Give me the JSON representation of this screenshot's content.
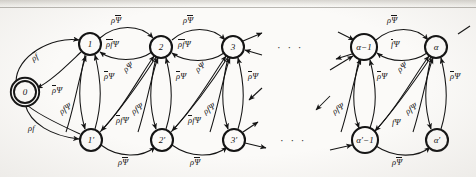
{
  "figure": {
    "background": "#fbfaf8",
    "ink": "#141414",
    "ellipsis": "· · ·"
  },
  "nodes": {
    "top": [
      {
        "id": "n0",
        "label": "0",
        "cx": 25,
        "cy": 92,
        "r": 11,
        "double": true
      },
      {
        "id": "n1",
        "label": "1",
        "cx": 90,
        "cy": 44,
        "r": 11,
        "double": false
      },
      {
        "id": "n2",
        "label": "2",
        "cx": 161,
        "cy": 47,
        "r": 11,
        "double": false
      },
      {
        "id": "n3",
        "label": "3",
        "cx": 233,
        "cy": 47,
        "r": 11,
        "double": false
      },
      {
        "id": "na1",
        "label": "α−1",
        "cx": 364,
        "cy": 47,
        "r": 13,
        "double": false
      },
      {
        "id": "na",
        "label": "α",
        "cx": 436,
        "cy": 47,
        "r": 11,
        "double": false
      }
    ],
    "bottom": [
      {
        "id": "n1p",
        "label": "1′",
        "cx": 91,
        "cy": 140,
        "r": 11,
        "double": false
      },
      {
        "id": "n2p",
        "label": "2′",
        "cx": 162,
        "cy": 140,
        "r": 11,
        "double": false
      },
      {
        "id": "n3p",
        "label": "3′",
        "cx": 234,
        "cy": 140,
        "r": 11,
        "double": false
      },
      {
        "id": "na1p",
        "label": "α′−1",
        "cx": 365,
        "cy": 140,
        "r": 13,
        "double": false
      },
      {
        "id": "nap",
        "label": "α′",
        "cx": 437,
        "cy": 140,
        "r": 11,
        "double": false
      }
    ]
  },
  "ellipses": [
    {
      "id": "dots-top",
      "x": 277,
      "y": 41
    },
    {
      "id": "dots-bottom",
      "x": 280,
      "y": 134
    }
  ],
  "edge_labels": [
    {
      "id": "l-rho-fbar",
      "x": 32,
      "y": 55,
      "rot": -33,
      "parts": [
        {
          "t": "ρ",
          "bar": false
        },
        {
          "t": "f",
          "bar": true
        }
      ]
    },
    {
      "id": "l-rhobar-psi-0",
      "x": 52,
      "y": 86,
      "rot": 0,
      "parts": [
        {
          "t": "ρ",
          "bar": true
        },
        {
          "t": "Ψ",
          "bar": false
        }
      ]
    },
    {
      "id": "l-rho-f",
      "x": 28,
      "y": 124,
      "rot": 0,
      "parts": [
        {
          "t": "ρ",
          "bar": false
        },
        {
          "t": "f",
          "bar": false
        }
      ]
    },
    {
      "id": "l-rho-psibar-12",
      "x": 111,
      "y": 16,
      "rot": 0,
      "parts": [
        {
          "t": "ρ",
          "bar": false
        },
        {
          "t": "Ψ",
          "bar": true
        }
      ]
    },
    {
      "id": "l-rho-psibar-23",
      "x": 183,
      "y": 16,
      "rot": 0,
      "parts": [
        {
          "t": "ρ",
          "bar": false
        },
        {
          "t": "Ψ",
          "bar": true
        }
      ]
    },
    {
      "id": "l-rho-psibar-aa",
      "x": 387,
      "y": 16,
      "rot": 0,
      "parts": [
        {
          "t": "ρ",
          "bar": false
        },
        {
          "t": "Ψ",
          "bar": true
        }
      ]
    },
    {
      "id": "l-rhobar-fbar-psi-21",
      "x": 106,
      "y": 40,
      "rot": 0,
      "parts": [
        {
          "t": "ρ",
          "bar": true
        },
        {
          "t": "f",
          "bar": true
        },
        {
          "t": "Ψ",
          "bar": false
        }
      ]
    },
    {
      "id": "l-rhobar-fbar-psi-32",
      "x": 178,
      "y": 40,
      "rot": 0,
      "parts": [
        {
          "t": "ρ",
          "bar": true
        },
        {
          "t": "f",
          "bar": true
        },
        {
          "t": "Ψ",
          "bar": false
        }
      ]
    },
    {
      "id": "l-fbar-psi-aa",
      "x": 391,
      "y": 40,
      "rot": 0,
      "parts": [
        {
          "t": "f",
          "bar": true
        },
        {
          "t": "Ψ",
          "bar": false
        }
      ]
    },
    {
      "id": "l-rhobar-psi-1",
      "x": 104,
      "y": 72,
      "rot": 0,
      "parts": [
        {
          "t": "ρ",
          "bar": true
        },
        {
          "t": "Ψ",
          "bar": false
        }
      ]
    },
    {
      "id": "l-rho-psi-1",
      "x": 124,
      "y": 66,
      "rot": -38,
      "parts": [
        {
          "t": "ρ",
          "bar": false
        },
        {
          "t": "Ψ",
          "bar": false
        }
      ]
    },
    {
      "id": "l-rhobar-psi-2",
      "x": 176,
      "y": 72,
      "rot": 0,
      "parts": [
        {
          "t": "ρ",
          "bar": true
        },
        {
          "t": "Ψ",
          "bar": false
        }
      ]
    },
    {
      "id": "l-rho-psi-2",
      "x": 196,
      "y": 66,
      "rot": -38,
      "parts": [
        {
          "t": "ρ",
          "bar": false
        },
        {
          "t": "Ψ",
          "bar": false
        }
      ]
    },
    {
      "id": "l-rhobar-psi-3",
      "x": 248,
      "y": 72,
      "rot": 0,
      "parts": [
        {
          "t": "ρ",
          "bar": true
        },
        {
          "t": "Ψ",
          "bar": false
        }
      ]
    },
    {
      "id": "l-rhobar-psi-a1",
      "x": 377,
      "y": 72,
      "rot": 0,
      "parts": [
        {
          "t": "ρ",
          "bar": true
        },
        {
          "t": "Ψ",
          "bar": false
        }
      ]
    },
    {
      "id": "l-rho-psi-a1",
      "x": 398,
      "y": 66,
      "rot": -38,
      "parts": [
        {
          "t": "ρ",
          "bar": false
        },
        {
          "t": "Ψ",
          "bar": false
        }
      ]
    },
    {
      "id": "l-rhobar-psi-a",
      "x": 450,
      "y": 72,
      "rot": 0,
      "parts": [
        {
          "t": "ρ",
          "bar": true
        },
        {
          "t": "Ψ",
          "bar": false
        }
      ]
    },
    {
      "id": "l-rho-f-psi-1",
      "x": 60,
      "y": 108,
      "rot": -34,
      "parts": [
        {
          "t": "ρ",
          "bar": false
        },
        {
          "t": "f",
          "bar": false
        },
        {
          "t": "Ψ",
          "bar": false
        }
      ]
    },
    {
      "id": "l-rhobar-f-psi-1",
      "x": 116,
      "y": 116,
      "rot": 0,
      "parts": [
        {
          "t": "ρ",
          "bar": true
        },
        {
          "t": "f",
          "bar": false
        },
        {
          "t": "Ψ",
          "bar": false
        }
      ]
    },
    {
      "id": "l-rho-f-psi-2",
      "x": 132,
      "y": 108,
      "rot": -34,
      "parts": [
        {
          "t": "ρ",
          "bar": false
        },
        {
          "t": "f",
          "bar": false
        },
        {
          "t": "Ψ",
          "bar": false
        }
      ]
    },
    {
      "id": "l-rhobar-f-psi-2",
      "x": 188,
      "y": 116,
      "rot": 0,
      "parts": [
        {
          "t": "ρ",
          "bar": true
        },
        {
          "t": "f",
          "bar": false
        },
        {
          "t": "Ψ",
          "bar": false
        }
      ]
    },
    {
      "id": "l-rho-f-psi-3",
      "x": 204,
      "y": 108,
      "rot": -34,
      "parts": [
        {
          "t": "ρ",
          "bar": false
        },
        {
          "t": "f",
          "bar": false
        },
        {
          "t": "Ψ",
          "bar": false
        }
      ]
    },
    {
      "id": "l-rho-f-psi-a1",
      "x": 333,
      "y": 108,
      "rot": -34,
      "parts": [
        {
          "t": "ρ",
          "bar": false
        },
        {
          "t": "f",
          "bar": false
        },
        {
          "t": "Ψ",
          "bar": false
        }
      ]
    },
    {
      "id": "l-f-psi-a1",
      "x": 392,
      "y": 118,
      "rot": 0,
      "parts": [
        {
          "t": "f",
          "bar": false
        },
        {
          "t": "Ψ",
          "bar": false
        }
      ]
    },
    {
      "id": "l-rho-f-psi-a",
      "x": 406,
      "y": 108,
      "rot": -34,
      "parts": [
        {
          "t": "ρ",
          "bar": false
        },
        {
          "t": "f",
          "bar": false
        },
        {
          "t": "Ψ",
          "bar": false
        }
      ]
    },
    {
      "id": "l-rho-psibar-b1",
      "x": 118,
      "y": 158,
      "rot": 0,
      "parts": [
        {
          "t": "ρ",
          "bar": false
        },
        {
          "t": "Ψ",
          "bar": true
        }
      ]
    },
    {
      "id": "l-rho-psibar-b2",
      "x": 190,
      "y": 158,
      "rot": 0,
      "parts": [
        {
          "t": "ρ",
          "bar": false
        },
        {
          "t": "Ψ",
          "bar": true
        }
      ]
    },
    {
      "id": "l-rho-psibar-b3",
      "x": 392,
      "y": 158,
      "rot": 0,
      "parts": [
        {
          "t": "ρ",
          "bar": false
        },
        {
          "t": "Ψ",
          "bar": true
        }
      ]
    }
  ]
}
